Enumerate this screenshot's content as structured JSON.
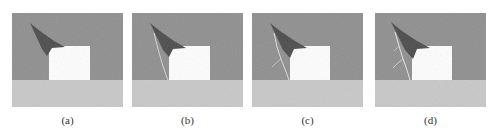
{
  "figure": {
    "panels": [
      {
        "id": "a",
        "label": "(a)",
        "left": 12,
        "crack_level": 0
      },
      {
        "id": "b",
        "label": "(b)",
        "left": 132,
        "crack_level": 1
      },
      {
        "id": "c",
        "label": "(c)",
        "left": 252,
        "crack_level": 2
      },
      {
        "id": "d",
        "label": "(d)",
        "left": 375,
        "crack_level": 3
      }
    ],
    "colors": {
      "upper_region": "#8e8e8e",
      "lower_region": "#c8c8c8",
      "inclusion_box": "#ffffff",
      "damage_zone": "#4a4a4a",
      "crack": "#e6e6e6"
    }
  }
}
